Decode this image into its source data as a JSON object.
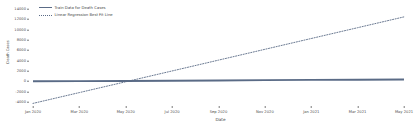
{
  "chart_data": {
    "type": "line",
    "title": "",
    "xlabel": "Date",
    "ylabel": "Death Cases",
    "xtick_labels": [
      "Jan 2020",
      "Mar 2020",
      "May 2020",
      "Jul 2020",
      "Sep 2020",
      "Nov 2020",
      "Jan 2021",
      "Mar 2021",
      "May 2021"
    ],
    "ytick_labels": [
      "14000",
      "12000",
      "10000",
      "8000",
      "6000",
      "4000",
      "2000",
      "0",
      "-2000",
      "-4000"
    ],
    "ytick_values": [
      14000,
      12000,
      10000,
      8000,
      6000,
      4000,
      2000,
      0,
      -2000,
      -4000
    ],
    "ylim": [
      -5000,
      15000
    ],
    "xlim": [
      "2020-01-01",
      "2021-06-15"
    ],
    "grid": false,
    "legend_position": "upper left",
    "series": [
      {
        "name": "Train Data for Death Cases",
        "style": "solid",
        "color": "#5a6b86",
        "x": [
          "Jan 2020",
          "Mar 2020",
          "May 2020",
          "Jul 2020",
          "Sep 2020",
          "Nov 2020",
          "Jan 2021",
          "Mar 2021",
          "May 2021"
        ],
        "values": [
          0,
          20,
          60,
          110,
          160,
          210,
          260,
          300,
          330
        ]
      },
      {
        "name": "Linear Regression Best Fit Line",
        "style": "dotted",
        "color": "#5a6b86",
        "x": [
          "Jan 2020",
          "Mar 2020",
          "May 2020",
          "Jul 2020",
          "Sep 2020",
          "Nov 2020",
          "Jan 2021",
          "Mar 2021",
          "May 2021"
        ],
        "values": [
          -4300,
          -2200,
          -100,
          2000,
          4100,
          6200,
          8300,
          10400,
          12500
        ]
      }
    ]
  },
  "legend": {
    "items": [
      {
        "label": "Train Data for Death Cases"
      },
      {
        "label": "Linear Regression Best Fit Line"
      }
    ]
  },
  "axes": {
    "xlabel": "Date",
    "ylabel": "Death Cases"
  },
  "colors": {
    "series": "#5a6b86",
    "tick_text": "#4d4d4d",
    "background": "#ffffff"
  }
}
